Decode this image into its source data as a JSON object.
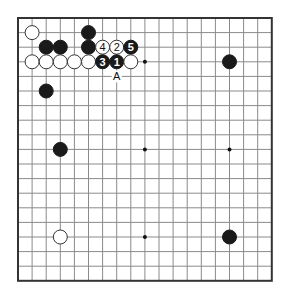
{
  "diagram": {
    "type": "go-board",
    "size": 19,
    "board": {
      "origin_x": 18,
      "origin_y": 18,
      "spacing_x": 14.1,
      "spacing_y": 14.6,
      "stone_radius": 7
    },
    "colors": {
      "black_stone": "#1a1a1a",
      "white_stone": "#ffffff",
      "grid": "#8a8a8a",
      "border": "#333333"
    },
    "star_points": [
      {
        "col": 3,
        "row": 3
      },
      {
        "col": 9,
        "row": 3
      },
      {
        "col": 15,
        "row": 3
      },
      {
        "col": 3,
        "row": 9
      },
      {
        "col": 9,
        "row": 9
      },
      {
        "col": 15,
        "row": 9
      },
      {
        "col": 3,
        "row": 15
      },
      {
        "col": 9,
        "row": 15
      },
      {
        "col": 15,
        "row": 15
      }
    ],
    "stones": [
      {
        "color": "white",
        "col": 1,
        "row": 1,
        "label": ""
      },
      {
        "color": "black",
        "col": 5,
        "row": 1,
        "label": ""
      },
      {
        "color": "black",
        "col": 2,
        "row": 2,
        "label": ""
      },
      {
        "color": "black",
        "col": 3,
        "row": 2,
        "label": ""
      },
      {
        "color": "black",
        "col": 5,
        "row": 2,
        "label": ""
      },
      {
        "color": "white",
        "col": 6,
        "row": 2,
        "label": "4"
      },
      {
        "color": "white",
        "col": 7,
        "row": 2,
        "label": "2"
      },
      {
        "color": "black",
        "col": 8,
        "row": 2,
        "label": "5"
      },
      {
        "color": "white",
        "col": 1,
        "row": 3,
        "label": ""
      },
      {
        "color": "white",
        "col": 2,
        "row": 3,
        "label": ""
      },
      {
        "color": "white",
        "col": 3,
        "row": 3,
        "label": ""
      },
      {
        "color": "white",
        "col": 4,
        "row": 3,
        "label": ""
      },
      {
        "color": "white",
        "col": 5,
        "row": 3,
        "label": ""
      },
      {
        "color": "black",
        "col": 6,
        "row": 3,
        "label": "3"
      },
      {
        "color": "black",
        "col": 7,
        "row": 3,
        "label": "1"
      },
      {
        "color": "white",
        "col": 8,
        "row": 3,
        "label": ""
      },
      {
        "color": "black",
        "col": 15,
        "row": 3,
        "label": ""
      },
      {
        "color": "black",
        "col": 2,
        "row": 5,
        "label": ""
      },
      {
        "color": "black",
        "col": 3,
        "row": 9,
        "label": ""
      },
      {
        "color": "white",
        "col": 3,
        "row": 15,
        "label": ""
      },
      {
        "color": "black",
        "col": 15,
        "row": 15,
        "label": ""
      }
    ],
    "point_labels": [
      {
        "text": "A",
        "col": 7,
        "row": 4
      }
    ]
  }
}
